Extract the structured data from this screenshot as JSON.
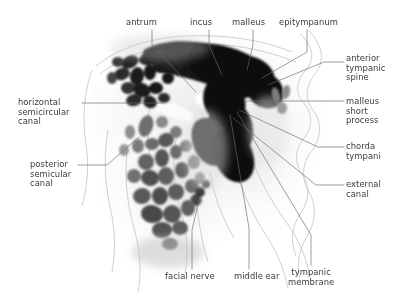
{
  "figure": {
    "kind": "labeled-radiograph",
    "modality_depicted": "temporal bone scan",
    "background_color": "#ffffff",
    "text_color": "#3a3a3a",
    "leader_line_color": "#6b6b6b",
    "contour_line_color": "#c9c9c9",
    "width": 399,
    "height": 301
  },
  "labels": [
    {
      "id": "antrum",
      "text": "antrum",
      "lines": [
        "antrum"
      ],
      "align": "center",
      "x": 126,
      "y": 18,
      "leader": [
        [
          152,
          30
        ],
        [
          152,
          45
        ],
        [
          196,
          92
        ]
      ]
    },
    {
      "id": "incus",
      "text": "incus",
      "lines": [
        "incus"
      ],
      "align": "center",
      "x": 190,
      "y": 18,
      "leader": [
        [
          209,
          30
        ],
        [
          209,
          45
        ],
        [
          222,
          75
        ]
      ]
    },
    {
      "id": "malleus",
      "text": "malleus",
      "lines": [
        "malleus"
      ],
      "align": "center",
      "x": 232,
      "y": 18,
      "leader": [
        [
          253,
          30
        ],
        [
          253,
          45
        ],
        [
          247,
          70
        ]
      ]
    },
    {
      "id": "epitympanum",
      "text": "epitympanum",
      "lines": [
        "epitympanum"
      ],
      "align": "center",
      "x": 279,
      "y": 18,
      "leader": [
        [
          307,
          30
        ],
        [
          307,
          52
        ],
        [
          262,
          78
        ]
      ]
    },
    {
      "id": "anterior-tympanic-spine",
      "text": "anterior tympanic spine",
      "lines": [
        "anterior",
        "tympanic",
        "spine"
      ],
      "align": "right",
      "x": 346,
      "y": 54,
      "leader": [
        [
          344,
          62
        ],
        [
          324,
          62
        ],
        [
          268,
          85
        ]
      ]
    },
    {
      "id": "malleus-short-process",
      "text": "malleus short process",
      "lines": [
        "malleus",
        "short",
        "process"
      ],
      "align": "right",
      "x": 346,
      "y": 97,
      "leader": [
        [
          344,
          101
        ],
        [
          244,
          101
        ]
      ]
    },
    {
      "id": "chorda-tympani",
      "text": "chorda tympani",
      "lines": [
        "chorda",
        "tympani"
      ],
      "align": "right",
      "x": 346,
      "y": 142,
      "leader": [
        [
          344,
          147
        ],
        [
          318,
          147
        ],
        [
          239,
          110
        ]
      ]
    },
    {
      "id": "external-canal",
      "text": "external canal",
      "lines": [
        "external",
        "canal"
      ],
      "align": "right",
      "x": 346,
      "y": 180,
      "leader": [
        [
          344,
          185
        ],
        [
          316,
          185
        ],
        [
          233,
          118
        ]
      ]
    },
    {
      "id": "horizontal-semicircular-canal",
      "text": "horizontal semicircular canal",
      "lines": [
        "horizontal",
        "semicircular",
        "canal"
      ],
      "align": "left",
      "x": 18,
      "y": 98,
      "leader": [
        [
          82,
          103
        ],
        [
          162,
          103
        ]
      ]
    },
    {
      "id": "posterior-semicular-canal",
      "text": "posterior semicular canal",
      "lines": [
        "posterior",
        "semicular",
        "canal"
      ],
      "align": "left",
      "x": 30,
      "y": 160,
      "leader": [
        [
          78,
          165
        ],
        [
          107,
          165
        ],
        [
          139,
          137
        ]
      ]
    },
    {
      "id": "facial-nerve",
      "text": "facial nerve",
      "lines": [
        "facial nerve"
      ],
      "align": "center",
      "x": 165,
      "y": 272,
      "leader": [
        [
          192,
          269
        ],
        [
          192,
          230
        ],
        [
          200,
          196
        ]
      ]
    },
    {
      "id": "middle-ear",
      "text": "middle ear",
      "lines": [
        "middle ear"
      ],
      "align": "center",
      "x": 234,
      "y": 272,
      "leader": [
        [
          249,
          269
        ],
        [
          249,
          228
        ],
        [
          230,
          115
        ]
      ]
    },
    {
      "id": "tympanic-membrane",
      "text": "tympanic membrane",
      "lines": [
        "tympanic",
        "membrane"
      ],
      "align": "center",
      "x": 288,
      "y": 268,
      "leader": [
        [
          311,
          265
        ],
        [
          311,
          235
        ],
        [
          237,
          112
        ]
      ]
    }
  ]
}
